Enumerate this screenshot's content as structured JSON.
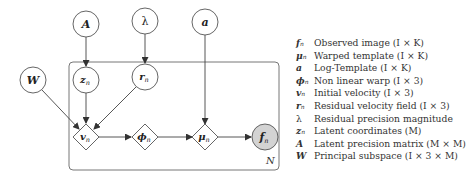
{
  "diagram": {
    "plate_label": "N",
    "nodes": {
      "A": {
        "label": "A",
        "sub": "",
        "shape": "circle"
      },
      "lambda": {
        "label": "λ",
        "sub": "",
        "shape": "circle"
      },
      "a": {
        "label": "a",
        "sub": "",
        "shape": "circle"
      },
      "W": {
        "label": "W",
        "sub": "",
        "shape": "circle"
      },
      "z": {
        "label": "z",
        "sub": "n",
        "shape": "circle"
      },
      "r": {
        "label": "r",
        "sub": "n",
        "shape": "circle"
      },
      "v": {
        "label": "v",
        "sub": "n",
        "shape": "diamond"
      },
      "phi": {
        "label": "ϕ",
        "sub": "n",
        "shape": "diamond"
      },
      "mu": {
        "label": "μ",
        "sub": "n",
        "shape": "diamond"
      },
      "f": {
        "label": "f",
        "sub": "n",
        "shape": "circle-observed"
      }
    },
    "edges": [
      [
        "A",
        "z"
      ],
      [
        "lambda",
        "r"
      ],
      [
        "a",
        "mu"
      ],
      [
        "W",
        "v"
      ],
      [
        "z",
        "v"
      ],
      [
        "r",
        "v"
      ],
      [
        "v",
        "phi"
      ],
      [
        "phi",
        "mu"
      ],
      [
        "mu",
        "f"
      ]
    ],
    "colors": {
      "stroke": "#555555",
      "observed_fill": "#d3d3d3",
      "background": "#ffffff"
    }
  },
  "legend": [
    {
      "sym": "f",
      "sub": "n",
      "desc": "Observed image (I × K)"
    },
    {
      "sym": "μ",
      "sub": "n",
      "desc": "Warped template (I × K)"
    },
    {
      "sym": "a",
      "sub": "",
      "desc": "Log-Template (I × K)"
    },
    {
      "sym": "ϕ",
      "sub": "n",
      "desc": "Non linear warp (I × 3)"
    },
    {
      "sym": "v",
      "sub": "n",
      "desc": "Initial velocity (I × 3)"
    },
    {
      "sym": "r",
      "sub": "n",
      "desc": "Residual velocity field (I × 3)"
    },
    {
      "sym": "λ",
      "sub": "",
      "desc": "Residual precision magnitude"
    },
    {
      "sym": "z",
      "sub": "n",
      "desc": "Latent coordinates (M)"
    },
    {
      "sym": "A",
      "sub": "",
      "desc": "Latent precision matrix (M × M)"
    },
    {
      "sym": "W",
      "sub": "",
      "desc": "Principal subspace (I × 3 × M)"
    }
  ]
}
